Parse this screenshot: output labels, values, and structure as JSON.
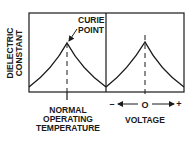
{
  "diagram": {
    "y_axis_label_line1": "DIELECTRIC",
    "y_axis_label_line2": "CONSTANT",
    "left_panel": {
      "annotation_line1": "CURIE",
      "annotation_line2": "POINT",
      "x_label_line1": "NORMAL",
      "x_label_line2": "OPERATING",
      "x_label_line3": "TEMPERATURE"
    },
    "right_panel": {
      "axis_minus": "–",
      "axis_zero": "O",
      "axis_plus": "+",
      "x_label": "VOLTAGE"
    },
    "colors": {
      "line": "#1a1a1a",
      "background": "#ffffff"
    }
  }
}
